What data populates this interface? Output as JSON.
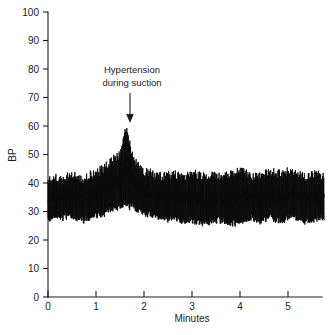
{
  "chart_data": {
    "type": "line",
    "title": "",
    "xlabel": "Minutes",
    "ylabel": "BP",
    "xlim": [
      0,
      5.75
    ],
    "ylim": [
      0,
      100
    ],
    "grid": false,
    "legend": null,
    "x_ticks": [
      "0",
      "1",
      "2",
      "3",
      "4",
      "5"
    ],
    "x_tick_values": [
      0,
      1,
      2,
      3,
      4,
      5
    ],
    "y_ticks": [
      "0",
      "10",
      "20",
      "30",
      "40",
      "50",
      "60",
      "70",
      "80",
      "90",
      "100"
    ],
    "y_tick_values": [
      0,
      10,
      20,
      30,
      40,
      50,
      60,
      70,
      80,
      90,
      100
    ],
    "series": [
      {
        "name": "Arterial blood pressure",
        "description": "Continuous arterial blood pressure pulse trace; rapid systolic/diastolic oscillations around a mean baseline with a transient hypertensive surge near 1.65 minutes.",
        "baseline_systolic": 42,
        "baseline_diastolic": 28,
        "peak_systolic": 59,
        "peak_time_minutes": 1.65,
        "pulse_rate_per_minute": 78,
        "envelope": [
          {
            "t": 0.0,
            "sys": 41,
            "dia": 28
          },
          {
            "t": 0.15,
            "sys": 42,
            "dia": 29
          },
          {
            "t": 0.3,
            "sys": 41,
            "dia": 28
          },
          {
            "t": 0.45,
            "sys": 43,
            "dia": 29
          },
          {
            "t": 0.6,
            "sys": 42,
            "dia": 28
          },
          {
            "t": 0.75,
            "sys": 41,
            "dia": 27
          },
          {
            "t": 0.9,
            "sys": 43,
            "dia": 29
          },
          {
            "t": 1.05,
            "sys": 44,
            "dia": 29
          },
          {
            "t": 1.2,
            "sys": 46,
            "dia": 30
          },
          {
            "t": 1.35,
            "sys": 48,
            "dia": 31
          },
          {
            "t": 1.5,
            "sys": 50,
            "dia": 32
          },
          {
            "t": 1.62,
            "sys": 59,
            "dia": 33
          },
          {
            "t": 1.72,
            "sys": 52,
            "dia": 32
          },
          {
            "t": 1.85,
            "sys": 46,
            "dia": 31
          },
          {
            "t": 2.0,
            "sys": 44,
            "dia": 30
          },
          {
            "t": 2.2,
            "sys": 43,
            "dia": 29
          },
          {
            "t": 2.4,
            "sys": 42,
            "dia": 28
          },
          {
            "t": 2.6,
            "sys": 43,
            "dia": 28
          },
          {
            "t": 2.8,
            "sys": 42,
            "dia": 27
          },
          {
            "t": 3.0,
            "sys": 44,
            "dia": 27
          },
          {
            "t": 3.2,
            "sys": 42,
            "dia": 26
          },
          {
            "t": 3.4,
            "sys": 43,
            "dia": 27
          },
          {
            "t": 3.6,
            "sys": 42,
            "dia": 27
          },
          {
            "t": 3.8,
            "sys": 43,
            "dia": 26
          },
          {
            "t": 4.0,
            "sys": 44,
            "dia": 27
          },
          {
            "t": 4.2,
            "sys": 43,
            "dia": 28
          },
          {
            "t": 4.4,
            "sys": 42,
            "dia": 27
          },
          {
            "t": 4.6,
            "sys": 44,
            "dia": 28
          },
          {
            "t": 4.8,
            "sys": 43,
            "dia": 27
          },
          {
            "t": 5.0,
            "sys": 44,
            "dia": 28
          },
          {
            "t": 5.2,
            "sys": 43,
            "dia": 28
          },
          {
            "t": 5.4,
            "sys": 42,
            "dia": 27
          },
          {
            "t": 5.6,
            "sys": 43,
            "dia": 28
          },
          {
            "t": 5.75,
            "sys": 42,
            "dia": 28
          }
        ]
      }
    ],
    "annotations": [
      {
        "name": "hypertension-annotation",
        "text_line1": "Hypertension",
        "text_line2": "during suction",
        "point_to_time": 1.65,
        "point_to_value": 62,
        "arrow": "down"
      }
    ],
    "colors": {
      "trace": "#0a0a0a",
      "axis": "#1c1c1c",
      "background": "#ffffff"
    }
  }
}
